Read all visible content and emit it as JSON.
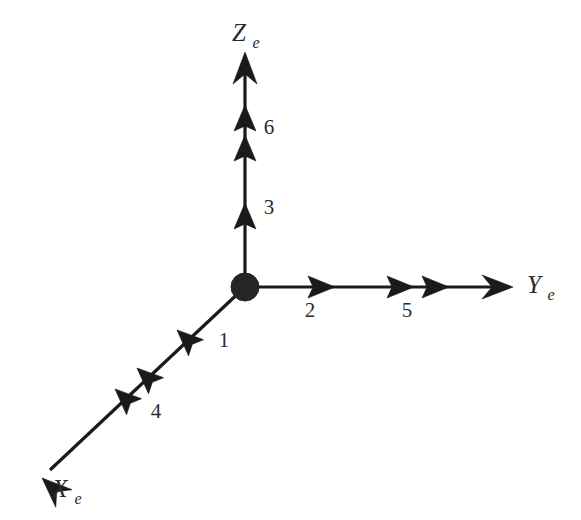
{
  "figure": {
    "kind": "3d-axes-sequence-diagram",
    "background_color": "#ffffff",
    "ink_color": "#1a1a1a",
    "origin": {
      "name": "origin-marker",
      "x": 245,
      "y": 287,
      "radius": 14
    }
  },
  "axes": [
    {
      "id": "x-axis",
      "label_base": "X",
      "label_sub": "e",
      "label_x": 66,
      "label_y": 496,
      "direction": "down-left",
      "start": {
        "x": 245,
        "y": 287
      },
      "end": {
        "x": 42,
        "y": 478
      },
      "tip_style": "open-barbed"
    },
    {
      "id": "y-axis",
      "label_base": "Y",
      "label_sub": "e",
      "label_x": 528,
      "label_y": 292,
      "direction": "right",
      "start": {
        "x": 245,
        "y": 287
      },
      "end": {
        "x": 512,
        "y": 287
      },
      "tip_style": "open-barbed"
    },
    {
      "id": "z-axis",
      "label_base": "Z",
      "label_sub": "e",
      "label_x": 233,
      "label_y": 40,
      "direction": "up",
      "start": {
        "x": 245,
        "y": 287
      },
      "end": {
        "x": 245,
        "y": 52
      },
      "tip_style": "open-barbed"
    }
  ],
  "markers": [
    {
      "id": "marker-1",
      "label": "1",
      "axis": "x-axis",
      "arrowhead_count": 1,
      "label_x": 224,
      "label_y": 347,
      "heads": [
        {
          "x": 177,
          "y": 330
        }
      ]
    },
    {
      "id": "marker-4",
      "label": "4",
      "axis": "x-axis",
      "arrowhead_count": 2,
      "label_x": 156,
      "label_y": 418,
      "heads": [
        {
          "x": 135,
          "y": 370
        },
        {
          "x": 114,
          "y": 390
        }
      ]
    },
    {
      "id": "marker-2",
      "label": "2",
      "axis": "y-axis",
      "arrowhead_count": 1,
      "label_x": 306,
      "label_y": 317,
      "heads": [
        {
          "x": 333,
          "y": 287
        }
      ]
    },
    {
      "id": "marker-5",
      "label": "5",
      "axis": "y-axis",
      "arrowhead_count": 2,
      "label_x": 403,
      "label_y": 317,
      "heads": [
        {
          "x": 412,
          "y": 287
        },
        {
          "x": 447,
          "y": 287
        }
      ]
    },
    {
      "id": "marker-3",
      "label": "3",
      "axis": "z-axis",
      "arrowhead_count": 1,
      "label_x": 265,
      "label_y": 214,
      "heads": [
        {
          "x": 245,
          "y": 205
        }
      ]
    },
    {
      "id": "marker-6",
      "label": "6",
      "axis": "z-axis",
      "arrowhead_count": 2,
      "label_x": 265,
      "label_y": 134,
      "heads": [
        {
          "x": 245,
          "y": 106
        },
        {
          "x": 245,
          "y": 136
        }
      ]
    }
  ],
  "sequence_order": [
    "1",
    "2",
    "3",
    "4",
    "5",
    "6"
  ]
}
